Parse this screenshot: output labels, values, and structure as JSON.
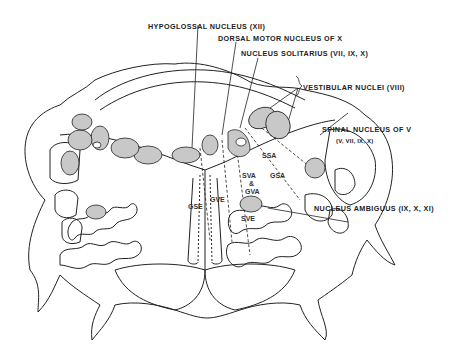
{
  "diagram": {
    "labels": {
      "hypoglossal": "HYPOGLOSSAL NUCLEUS (XII)",
      "dorsal_motor": "DORSAL MOTOR NUCLEUS OF X",
      "solitarius": "NUCLEUS SOLITARIUS (VII, IX, X)",
      "vestibular": "VESTIBULAR NUCLEI (VIII)",
      "spinal_v": "SPINAL NUCLEUS OF V",
      "spinal_v_sub": "(V, VII, IX, X)",
      "ambiguus": "NUCLEUS AMBIGUUS (IX, X, XI)"
    },
    "columns": {
      "gse": "GSE",
      "gve": "GVE",
      "sva": "SVA",
      "amp": "&",
      "gva": "GVA",
      "sve": "SVE",
      "ssa": "SSA",
      "gsa": "GSA"
    },
    "colors": {
      "outline": "#222222",
      "nucleus_fill": "#c8c8c8",
      "background": "#ffffff"
    }
  }
}
